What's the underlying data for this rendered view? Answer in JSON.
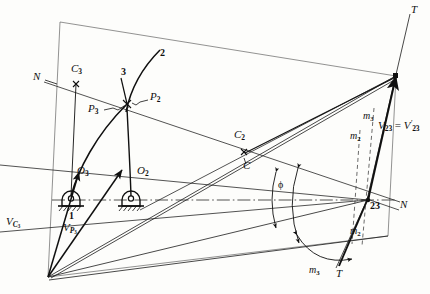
{
  "figure": {
    "background_color": "#fdfdfb",
    "ink_color": "#101010"
  },
  "labels": [
    {
      "id": "n-left",
      "name": "normal-line-label-left",
      "text": "N",
      "sub": "",
      "x": 33,
      "y": 78,
      "size": "sz-lg",
      "style": "italic"
    },
    {
      "id": "c3",
      "name": "point-label-c3",
      "text": "C",
      "sub": "3",
      "x": 71,
      "y": 70,
      "size": "sz-lg",
      "style": "italic"
    },
    {
      "id": "link3",
      "name": "link-number-3",
      "text": "3",
      "sub": "",
      "x": 121,
      "y": 74,
      "size": "sz-md",
      "style": "upright-bold"
    },
    {
      "id": "link2",
      "name": "link-number-2",
      "text": "2",
      "sub": "",
      "x": 160,
      "y": 55,
      "size": "sz-md",
      "style": "upright-bold"
    },
    {
      "id": "p2",
      "name": "point-label-p2",
      "text": "P",
      "sub": "2",
      "x": 150,
      "y": 98,
      "size": "sz-lg",
      "style": "italic"
    },
    {
      "id": "p3",
      "name": "point-label-p3",
      "text": "P",
      "sub": "3",
      "x": 90,
      "y": 110,
      "size": "sz-lg",
      "style": "italic"
    },
    {
      "id": "o3",
      "name": "pivot-label-o3",
      "text": "O",
      "sub": "3",
      "x": 78,
      "y": 172,
      "size": "sz-lg",
      "style": "italic"
    },
    {
      "id": "o2",
      "name": "pivot-label-o2",
      "text": "O",
      "sub": "2",
      "x": 138,
      "y": 172,
      "size": "sz-lg",
      "style": "italic"
    },
    {
      "id": "frame1",
      "name": "frame-link-number-1",
      "text": "1",
      "sub": "",
      "x": 69,
      "y": 214,
      "size": "sz-md",
      "style": "upright-bold"
    },
    {
      "id": "vc3",
      "name": "velocity-label-vc3",
      "text": "V",
      "sub": "C3",
      "x": 8,
      "y": 222,
      "size": "sz-lg",
      "style": "italic"
    },
    {
      "id": "vp3",
      "name": "velocity-label-vp3",
      "text": "V",
      "sub": "P3",
      "x": 64,
      "y": 228,
      "size": "sz-lg",
      "style": "italic"
    },
    {
      "id": "c2",
      "name": "point-label-c2",
      "text": "C",
      "sub": "2",
      "x": 236,
      "y": 136,
      "size": "sz-lg",
      "style": "italic"
    },
    {
      "id": "c",
      "name": "point-label-c",
      "text": "C",
      "sub": "",
      "x": 243,
      "y": 167,
      "size": "sz-lg",
      "style": "italic"
    },
    {
      "id": "phi",
      "name": "angle-label-phi",
      "text": "ϕ",
      "sub": "",
      "x": 281,
      "y": 186,
      "size": "sz-md",
      "style": "upright"
    },
    {
      "id": "pt23",
      "name": "instant-centre-label-23",
      "text": "23",
      "sub": "",
      "x": 371,
      "y": 204,
      "size": "sz-md",
      "style": "upright-bold"
    },
    {
      "id": "n-right",
      "name": "normal-line-label-right",
      "text": "N",
      "sub": "",
      "x": 400,
      "y": 205,
      "size": "sz-lg",
      "style": "italic"
    },
    {
      "id": "t-top",
      "name": "tangent-line-label-top",
      "text": "T",
      "sub": "",
      "x": 412,
      "y": 6,
      "size": "sz-lg",
      "style": "italic"
    },
    {
      "id": "t-bottom",
      "name": "tangent-line-label-bottom",
      "text": "T",
      "sub": "",
      "x": 335,
      "y": 272,
      "size": "sz-lg",
      "style": "italic"
    },
    {
      "id": "m3-top",
      "name": "slope-label-m3-top",
      "text": "m",
      "sub": "3",
      "x": 363,
      "y": 117,
      "size": "sz-md",
      "style": "italic"
    },
    {
      "id": "m2-top",
      "name": "slope-label-m2-top",
      "text": "m",
      "sub": "2",
      "x": 351,
      "y": 137,
      "size": "sz-md",
      "style": "italic"
    },
    {
      "id": "m2-bottom",
      "name": "slope-label-m2-bottom",
      "text": "m",
      "sub": "2",
      "x": 351,
      "y": 232,
      "size": "sz-md",
      "style": "italic"
    },
    {
      "id": "m3-bottom",
      "name": "slope-label-m3-bottom",
      "text": "m",
      "sub": "3",
      "x": 310,
      "y": 270,
      "size": "sz-md",
      "style": "italic"
    }
  ],
  "v23_label": {
    "name": "velocity-label-v23",
    "x": 381,
    "y": 127,
    "base": "V",
    "sub1": "23",
    "equals": " = ",
    "base2": "V",
    "prime": "′",
    "sub2": "23"
  }
}
